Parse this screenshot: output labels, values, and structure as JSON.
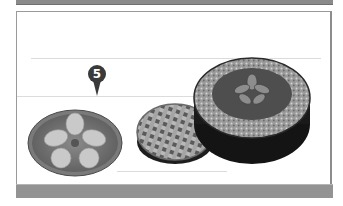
{
  "figure": {
    "callout": {
      "number": "5",
      "color": "#3a3a3a"
    },
    "items": [
      {
        "name": "Flat pie with petal-pattern crust"
      },
      {
        "name": "Lattice-top pie"
      },
      {
        "name": "Deep-dish pie with decorative leaf topping"
      }
    ],
    "colors": {
      "band": "#8f8f8f",
      "frame_border": "#9a9a9a",
      "rule": "#dcdcdc"
    }
  }
}
